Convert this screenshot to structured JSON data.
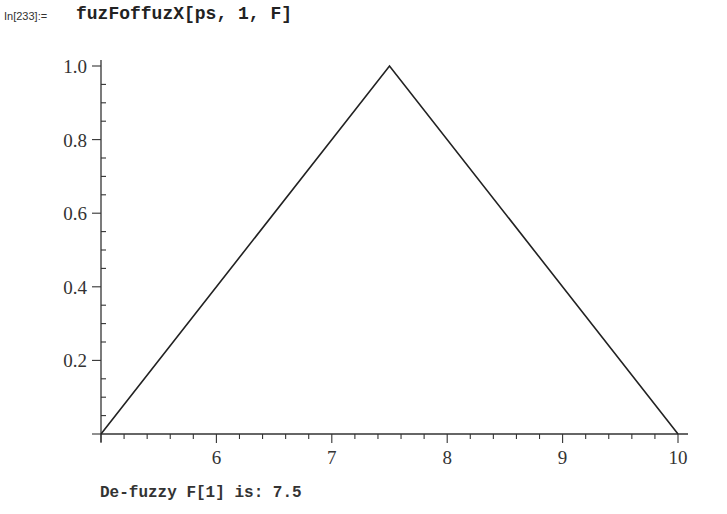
{
  "input": {
    "label": "In[233]:=",
    "code": "fuzFoffuzX[ps, 1, F]"
  },
  "output": {
    "text": "De-fuzzy F[1] is: 7.5"
  },
  "chart_data": {
    "type": "line",
    "title": "",
    "xlabel": "",
    "ylabel": "",
    "x": [
      5,
      7.5,
      10
    ],
    "series": [
      {
        "name": "membership",
        "values": [
          0,
          1.0,
          0
        ]
      }
    ],
    "xlim": [
      5,
      10
    ],
    "ylim": [
      0,
      1.0
    ],
    "x_ticks": [
      "6",
      "7",
      "8",
      "9",
      "10"
    ],
    "y_ticks": [
      "0.2",
      "0.4",
      "0.6",
      "0.8",
      "1.0"
    ],
    "grid": false,
    "legend": "none",
    "line_color": "#222222"
  }
}
